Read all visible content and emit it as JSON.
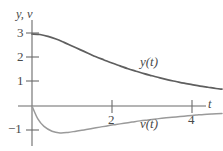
{
  "chart_data": {
    "type": "line",
    "title": "",
    "xlabel": "t",
    "ylabel": "y, v",
    "xlim": [
      -0.1,
      4.8
    ],
    "ylim": [
      -1.45,
      3.55
    ],
    "grid": false,
    "legend_position": "inline-annotation",
    "xticks": [
      2,
      4
    ],
    "xtick_labels": [
      "2",
      "4"
    ],
    "yticks": [
      1,
      2,
      3,
      -1
    ],
    "ytick_labels": [
      "1",
      "2",
      "3",
      "−1"
    ],
    "series": [
      {
        "name": "y(t)",
        "label": "y(t)",
        "color": "#5f5f5f",
        "x": [
          0.0,
          0.2,
          0.4,
          0.6,
          0.8,
          1.0,
          1.2,
          1.4,
          1.6,
          1.8,
          2.0,
          2.2,
          2.4,
          2.6,
          2.8,
          3.0,
          3.2,
          3.4,
          3.6,
          3.8,
          4.0,
          4.2,
          4.4,
          4.6,
          4.75
        ],
        "y": [
          3.0,
          2.98,
          2.9,
          2.79,
          2.65,
          2.5,
          2.35,
          2.2,
          2.05,
          1.92,
          1.79,
          1.67,
          1.55,
          1.45,
          1.35,
          1.26,
          1.17,
          1.09,
          1.02,
          0.95,
          0.89,
          0.83,
          0.78,
          0.73,
          0.7
        ]
      },
      {
        "name": "v(t)",
        "label": "v(t)",
        "color": "#9a9a9a",
        "x": [
          0.0,
          0.15,
          0.3,
          0.5,
          0.7,
          0.9,
          1.1,
          1.3,
          1.5,
          1.7,
          1.9,
          2.1,
          2.3,
          2.5,
          2.7,
          2.9,
          3.1,
          3.3,
          3.5,
          3.7,
          3.9,
          4.1,
          4.3,
          4.5,
          4.75
        ],
        "y": [
          0.0,
          -0.55,
          -0.85,
          -1.05,
          -1.12,
          -1.1,
          -1.05,
          -1.0,
          -0.94,
          -0.88,
          -0.82,
          -0.77,
          -0.72,
          -0.67,
          -0.62,
          -0.58,
          -0.54,
          -0.5,
          -0.47,
          -0.44,
          -0.41,
          -0.38,
          -0.35,
          -0.33,
          -0.31
        ]
      }
    ],
    "annotations": [
      {
        "text": "y(t)",
        "x": 2.7,
        "y": 1.85
      },
      {
        "text": "v(t)",
        "x": 2.7,
        "y": -0.75
      }
    ],
    "axis_color": "#6b6b6b"
  },
  "labels": {
    "axis_title": "y, v",
    "x_axis_title": "t",
    "ytick_3": "3",
    "ytick_2": "2",
    "ytick_1": "1",
    "ytick_minus1": "−1",
    "xtick_2": "2",
    "xtick_4": "4",
    "curve_y": "y(t)",
    "curve_v": "v(t)"
  }
}
